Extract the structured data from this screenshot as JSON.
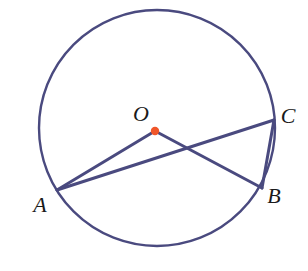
{
  "diagram": {
    "type": "geometry-circle",
    "canvas": {
      "width": 308,
      "height": 271,
      "background": "#ffffff"
    },
    "colors": {
      "stroke": "#4a4a7f",
      "center_dot": "#f0562a",
      "label_text": "#1a1a1a",
      "background": "#ffffff"
    },
    "circle": {
      "name": "main-circle",
      "cx": 157,
      "cy": 128,
      "r": 118,
      "stroke_width": 2.4
    },
    "center": {
      "name": "O",
      "label": "O",
      "x": 155,
      "y": 131,
      "dot_radius": 4.2,
      "label_x": 141,
      "label_y": 116
    },
    "points": [
      {
        "name": "A",
        "label": "A",
        "x": 57,
        "y": 190,
        "label_x": 40,
        "label_y": 207
      },
      {
        "name": "B",
        "label": "B",
        "x": 262,
        "y": 188,
        "label_x": 274,
        "label_y": 198
      },
      {
        "name": "C",
        "label": "C",
        "x": 274,
        "y": 120,
        "label_x": 288,
        "label_y": 118
      }
    ],
    "segments": [
      {
        "name": "radius-OA",
        "from": "A",
        "to": "O",
        "x1": 57,
        "y1": 190,
        "x2": 155,
        "y2": 131,
        "stroke_width": 3.0
      },
      {
        "name": "radius-OB",
        "from": "O",
        "to": "B",
        "x1": 155,
        "y1": 131,
        "x2": 262,
        "y2": 188,
        "stroke_width": 3.0
      },
      {
        "name": "chord-AC",
        "from": "A",
        "to": "C",
        "x1": 57,
        "y1": 190,
        "x2": 274,
        "y2": 120,
        "stroke_width": 3.0
      },
      {
        "name": "chord-CB",
        "from": "C",
        "to": "B",
        "x1": 274,
        "y1": 120,
        "x2": 262,
        "y2": 188,
        "stroke_width": 3.0
      }
    ],
    "intersection": {
      "name": "AC-OB-crossing",
      "x": 186,
      "y": 151
    }
  }
}
